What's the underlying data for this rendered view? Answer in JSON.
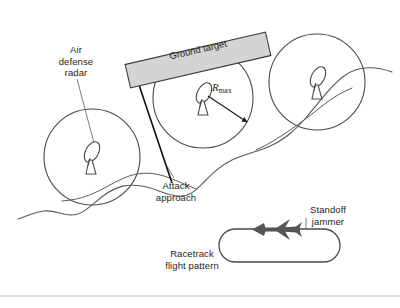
{
  "figure": {
    "type": "technical-diagram",
    "width": 400,
    "height": 308,
    "background_color": "#ffffff",
    "stroke_color": "#4a4a4a",
    "text_color": "#231f20"
  },
  "labels": {
    "air_defense_radar": "Air\ndefense\nradar",
    "ground_target": "Ground target",
    "r_max_symbol": "R",
    "r_max_subscript": "max",
    "attack_approach": "Attack\napproach",
    "racetrack_flight_pattern": "Racetrack\nflight pattern",
    "standoff_jammer": "Standoff\njammer"
  },
  "elements": {
    "radar_coverage_circles": [
      {
        "name": "radar-circle-left",
        "cx": 92,
        "cy": 157,
        "r": 48
      },
      {
        "name": "radar-circle-center",
        "cx": 203,
        "cy": 98,
        "r": 50
      },
      {
        "name": "radar-circle-right",
        "cx": 317,
        "cy": 82,
        "r": 48
      }
    ],
    "radar_dishes": [
      {
        "name": "radar-dish-left",
        "x": 92,
        "y": 157
      },
      {
        "name": "radar-dish-center",
        "x": 203,
        "y": 98
      },
      {
        "name": "radar-dish-right",
        "x": 317,
        "y": 82
      }
    ],
    "ground_target_banner": {
      "fill": "#d4d4d4",
      "stroke": "#3a3a3a",
      "rotation_deg": -13
    },
    "r_max_arrow": {
      "from_x": 207,
      "from_y": 96,
      "to_x": 248,
      "to_y": 124
    },
    "attack_arrow": {
      "from_x": 172,
      "from_y": 182,
      "to_x": 136,
      "to_y": 77
    },
    "leader_line_radar": {
      "from_x": 76,
      "from_y": 78,
      "to_x": 93,
      "to_y": 142
    },
    "racetrack": {
      "x": 219,
      "y": 229,
      "width": 121,
      "height": 33,
      "stroke": "#4a4a4a"
    },
    "jammer_aircraft": {
      "fill": "#555555",
      "heading": "left"
    },
    "terrain_line": {
      "name": "wavy-terrain-line",
      "stroke": "#5a5a5a"
    },
    "page_rule": {
      "y": 296,
      "color": "#b9b9bd"
    }
  }
}
